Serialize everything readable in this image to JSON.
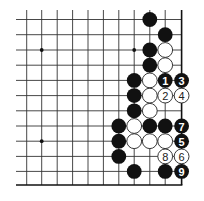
{
  "diagram": {
    "type": "go-board-fragment",
    "colors": {
      "black": "#111111",
      "white": "#ffffff",
      "line": "#333333",
      "background": "#ffffff"
    },
    "grid": {
      "cols_x": [
        26.7,
        41.7,
        57.2,
        72.6,
        88.0,
        103.4,
        118.8,
        134.2,
        149.8,
        165.2,
        181.6
      ],
      "rows_y": [
        19.5,
        34.7,
        50.0,
        65.2,
        80.4,
        95.6,
        110.8,
        126.0,
        141.2,
        156.4,
        171.4,
        185.0
      ],
      "right_edge": true,
      "bottom_edge": true,
      "extend_left_to": 16,
      "extend_top_to": 10
    },
    "hoshi": [
      {
        "col": 1,
        "row": 2
      },
      {
        "col": 7,
        "row": 2
      },
      {
        "col": 1,
        "row": 8
      }
    ],
    "stones": [
      {
        "col": 8,
        "row": 0,
        "color": "black",
        "label": ""
      },
      {
        "col": 9,
        "row": 1,
        "color": "black",
        "label": ""
      },
      {
        "col": 8,
        "row": 2,
        "color": "black",
        "label": ""
      },
      {
        "col": 9,
        "row": 2,
        "color": "white",
        "label": ""
      },
      {
        "col": 8,
        "row": 3,
        "color": "black",
        "label": ""
      },
      {
        "col": 9,
        "row": 3,
        "color": "white",
        "label": ""
      },
      {
        "col": 7,
        "row": 4,
        "color": "black",
        "label": ""
      },
      {
        "col": 8,
        "row": 4,
        "color": "white",
        "label": ""
      },
      {
        "col": 9,
        "row": 4,
        "color": "black",
        "label": "1"
      },
      {
        "col": 10,
        "row": 4,
        "color": "black",
        "label": "3"
      },
      {
        "col": 7,
        "row": 5,
        "color": "black",
        "label": ""
      },
      {
        "col": 8,
        "row": 5,
        "color": "white",
        "label": ""
      },
      {
        "col": 9,
        "row": 5,
        "color": "white",
        "label": "2"
      },
      {
        "col": 10,
        "row": 5,
        "color": "white",
        "label": "4"
      },
      {
        "col": 7,
        "row": 6,
        "color": "black",
        "label": ""
      },
      {
        "col": 8,
        "row": 6,
        "color": "white",
        "label": ""
      },
      {
        "col": 6,
        "row": 7,
        "color": "black",
        "label": ""
      },
      {
        "col": 7,
        "row": 7,
        "color": "white",
        "label": ""
      },
      {
        "col": 8,
        "row": 7,
        "color": "black",
        "label": ""
      },
      {
        "col": 9,
        "row": 7,
        "color": "black",
        "label": ""
      },
      {
        "col": 10,
        "row": 7,
        "color": "black",
        "label": "7"
      },
      {
        "col": 6,
        "row": 8,
        "color": "black",
        "label": ""
      },
      {
        "col": 7,
        "row": 8,
        "color": "white",
        "label": ""
      },
      {
        "col": 8,
        "row": 8,
        "color": "white",
        "label": ""
      },
      {
        "col": 9,
        "row": 8,
        "color": "white",
        "label": ""
      },
      {
        "col": 10,
        "row": 8,
        "color": "black",
        "label": "5"
      },
      {
        "col": 6,
        "row": 9,
        "color": "black",
        "label": ""
      },
      {
        "col": 9,
        "row": 9,
        "color": "white",
        "label": "8"
      },
      {
        "col": 10,
        "row": 9,
        "color": "white",
        "label": "6"
      },
      {
        "col": 7,
        "row": 10,
        "color": "black",
        "label": ""
      },
      {
        "col": 9,
        "row": 10,
        "color": "black",
        "label": ""
      },
      {
        "col": 10,
        "row": 10,
        "color": "black",
        "label": "9"
      }
    ],
    "stone_radius": 7.4
  }
}
